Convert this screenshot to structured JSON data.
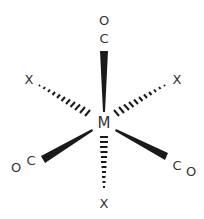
{
  "diagram": {
    "type": "octahedral-coordination-complex",
    "center_atom": "M",
    "ligands": [
      {
        "position": "top",
        "atoms": [
          "O",
          "C"
        ],
        "bond": "wedge"
      },
      {
        "position": "upper-left",
        "atoms": [
          "X"
        ],
        "bond": "hash"
      },
      {
        "position": "upper-right",
        "atoms": [
          "X"
        ],
        "bond": "hash"
      },
      {
        "position": "lower-left",
        "atoms": [
          "O",
          "C"
        ],
        "bond": "wedge"
      },
      {
        "position": "lower-right",
        "atoms": [
          "C",
          "O"
        ],
        "bond": "wedge"
      },
      {
        "position": "bottom",
        "atoms": [
          "X"
        ],
        "bond": "hash"
      }
    ],
    "colors": {
      "bond": "#1a1a1a",
      "text": "#333333",
      "background": "#ffffff"
    }
  }
}
